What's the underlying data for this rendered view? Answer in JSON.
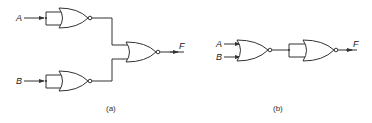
{
  "diagram": {
    "type": "logic-circuit",
    "panel_a": {
      "caption": "(a)",
      "inputs": [
        "A",
        "B"
      ],
      "output": "F",
      "gates": [
        {
          "id": "nor-a1",
          "type": "NOR",
          "inputs_tied": true,
          "input": "A"
        },
        {
          "id": "nor-a2",
          "type": "NOR",
          "inputs_tied": true,
          "input": "B"
        },
        {
          "id": "nor-a3",
          "type": "NOR",
          "inputs": [
            "nor-a1",
            "nor-a2"
          ],
          "output": "F"
        }
      ]
    },
    "panel_b": {
      "caption": "(b)",
      "inputs": [
        "A",
        "B"
      ],
      "output": "F",
      "gates": [
        {
          "id": "nor-b1",
          "type": "NOR",
          "inputs": [
            "A",
            "B"
          ]
        },
        {
          "id": "nor-b2",
          "type": "NOR",
          "inputs_tied": true,
          "input": "nor-b1",
          "output": "F"
        }
      ]
    }
  }
}
